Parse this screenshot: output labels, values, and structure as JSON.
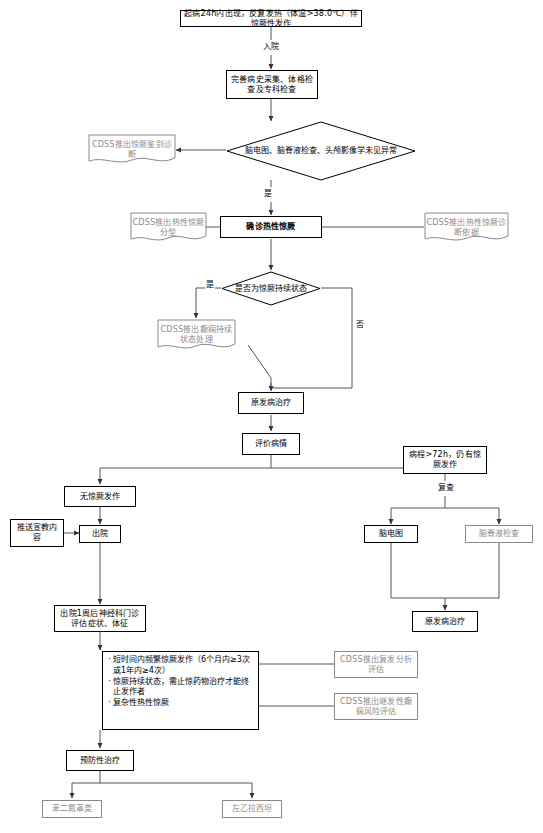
{
  "diagram": {
    "type": "flowchart",
    "colors": {
      "line": "#555555",
      "node_border": "#000000",
      "gray_text": "#8a8a8a",
      "background": "#ffffff"
    },
    "nodes": {
      "onset": "起病24h内出现，反复发热（体温>38.0℃）伴惊厥性发作",
      "workup": "完善病史采集、体格检查及专科检查",
      "decision_exams": "脑电图、脑脊液检查、头颅影像学未见异常",
      "cdss_differential": "CDSS推出惊厥鉴别诊断",
      "diagnosis": "确诊热性惊厥",
      "cdss_subtype": "CDSS推出热性惊厥分型",
      "cdss_criteria": "CDSS推出热性惊厥诊断依据",
      "decision_status": "是否为惊厥持续状态",
      "cdss_status_mgmt": "CDSS推出癫痫持续状态处理",
      "primary_treatment": "原发病治疗",
      "evaluate": "评价病情",
      "no_seizure": "无惊厥发作",
      "persistent": "病程>72h，仍有惊厥发作",
      "health_education": "推送宣教内容",
      "discharge": "出院",
      "eeg": "脑电图",
      "csf": "脑脊液检查",
      "primary_treatment_2": "原发病治疗",
      "followup": "出院1周后神经科门诊评估症状、体征",
      "cdss_relapse": "CDSS推出复发分析评估",
      "cdss_epilepsy_risk": "CDSS推出继发性癫痫风险评估",
      "prevention": "预防性治疗",
      "drug_benzo": "苯二氮䓬类",
      "drug_levetiracetam": "左乙拉西坦"
    },
    "criteria_list": [
      "短时间内频繁惊厥发作（6个月内≥3次或1年内≥4次）",
      "惊厥持续状态，需止惊药物治疗才能终止发作者",
      "复杂性热性惊厥"
    ],
    "edge_labels": {
      "admission": "入院",
      "yes_exams": "是",
      "yes_status": "是",
      "no_status": "否",
      "recheck": "复查"
    }
  }
}
